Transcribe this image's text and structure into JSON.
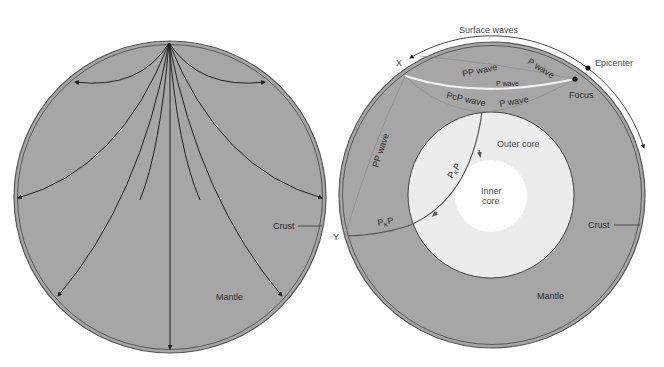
{
  "colors": {
    "mantle": "#a6a6a6",
    "outer_core": "#ececec",
    "inner_core": "#ffffff",
    "ray": "#222222",
    "ray_light": "#f2f2f2",
    "background": "#ffffff"
  },
  "left_diagram": {
    "labels": {
      "crust": "Crust",
      "mantle": "Mantle"
    },
    "ray_count": 9
  },
  "right_diagram": {
    "labels": {
      "surface_waves": "Surface waves",
      "epicenter": "Epicenter",
      "focus": "Focus",
      "x_point": "X",
      "y_point": "Y",
      "pp_wave_top": "PP wave",
      "p_wave_top": "P wave",
      "p_wave_mid": "P wave",
      "pcp_wave": "PcP wave",
      "p_wave_lower": "P wave",
      "pp_wave_side": "PP wave",
      "pkp_upper_main": "P",
      "pkp_upper_sub": "K",
      "pkp_upper_end": "P",
      "pkp_lower_main": "P",
      "pkp_lower_sub": "K",
      "pkp_lower_end": "P",
      "outer_core": "Outer core",
      "inner_core_line1": "Inner",
      "inner_core_line2": "core",
      "crust": "Crust",
      "mantle": "Mantle"
    }
  }
}
